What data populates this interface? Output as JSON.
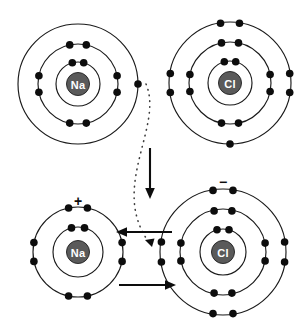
{
  "figure": {
    "background_color": "#ffffff",
    "ring_color": "#1a1a1a",
    "electron_color": "#0d0d0d",
    "nucleus_fill": "#5a5a5a",
    "nucleus_label_color": "#ffffff",
    "arrow_color": "#0d0d0d",
    "dotted_path_color": "#3d3d3d"
  },
  "atoms": {
    "sodium_atom": {
      "label": "Na",
      "charge": "",
      "center": {
        "x": 78,
        "y": 84
      },
      "shell_radii": [
        22,
        40,
        60
      ],
      "electron_radius": 3.8,
      "shells": [
        {
          "index": 1,
          "count": 2,
          "electron_angles": [
            255,
            285
          ]
        },
        {
          "index": 2,
          "count": 8,
          "electron_angles": [
            258,
            282,
            168,
            192,
            348,
            12,
            78,
            102
          ]
        },
        {
          "index": 3,
          "count": 1,
          "electron_angles": [
            0
          ]
        }
      ]
    },
    "chlorine_atom": {
      "label": "Cl",
      "charge": "",
      "center": {
        "x": 230,
        "y": 83
      },
      "shell_radii": [
        22,
        41,
        61
      ],
      "electron_radius": 3.8,
      "shells": [
        {
          "index": 1,
          "count": 2,
          "electron_angles": [
            255,
            285
          ]
        },
        {
          "index": 2,
          "count": 8,
          "electron_angles": [
            258,
            282,
            168,
            192,
            348,
            12,
            78,
            102
          ]
        },
        {
          "index": 3,
          "count": 7,
          "electron_angles": [
            258,
            282,
            168,
            192,
            348,
            12,
            90
          ]
        }
      ]
    },
    "sodium_ion": {
      "label": "Na",
      "charge": "+",
      "charge_position": {
        "x": 78,
        "y": 200
      },
      "center": {
        "x": 78,
        "y": 252
      },
      "shell_radii": [
        25,
        45
      ],
      "electron_radius": 3.8,
      "shells": [
        {
          "index": 1,
          "count": 2,
          "electron_angles": [
            255,
            285
          ]
        },
        {
          "index": 2,
          "count": 8,
          "electron_angles": [
            258,
            282,
            168,
            192,
            348,
            12,
            78,
            102
          ]
        }
      ]
    },
    "chloride_ion": {
      "label": "Cl",
      "charge": "−",
      "charge_position": {
        "x": 223,
        "y": 181
      },
      "center": {
        "x": 223,
        "y": 252
      },
      "shell_radii": [
        23,
        43,
        63
      ],
      "electron_radius": 3.8,
      "shells": [
        {
          "index": 1,
          "count": 2,
          "electron_angles": [
            255,
            285
          ]
        },
        {
          "index": 2,
          "count": 8,
          "electron_angles": [
            258,
            282,
            168,
            192,
            348,
            12,
            78,
            102
          ]
        },
        {
          "index": 3,
          "count": 8,
          "electron_angles": [
            258,
            282,
            168,
            192,
            348,
            12,
            78,
            102
          ]
        }
      ]
    }
  },
  "arrows": {
    "down_arrow": {
      "name": "downward-process-arrow",
      "from": {
        "x": 150,
        "y": 148
      },
      "to": {
        "x": 150,
        "y": 198
      }
    },
    "left_arrow": {
      "name": "leftward-attraction-arrow",
      "from": {
        "x": 172,
        "y": 232
      },
      "to": {
        "x": 118,
        "y": 232
      }
    },
    "right_arrow": {
      "name": "rightward-attraction-arrow",
      "from": {
        "x": 119,
        "y": 285
      },
      "to": {
        "x": 174,
        "y": 285
      }
    },
    "electron_transfer_path": {
      "name": "electron-transfer-dotted-path",
      "start": {
        "x": 146,
        "y": 84
      },
      "control_1": {
        "x": 163,
        "y": 128
      },
      "control_2": {
        "x": 110,
        "y": 188
      },
      "end": {
        "x": 151,
        "y": 243
      }
    }
  }
}
